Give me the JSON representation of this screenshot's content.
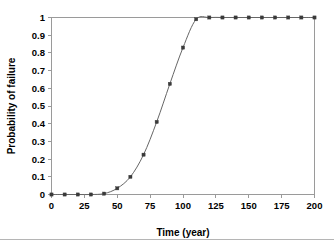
{
  "chart_data": {
    "type": "line",
    "title": "",
    "xlabel": "Time (year)",
    "ylabel": "Probability of failure",
    "xlim": [
      0,
      200
    ],
    "ylim": [
      0,
      1
    ],
    "grid": false,
    "legend": "none",
    "marker": "square",
    "line_color": "#666666",
    "marker_color": "#3a3a3a",
    "xticks": [
      0,
      25,
      50,
      75,
      100,
      125,
      150,
      175,
      200
    ],
    "xtick_labels": [
      "0",
      "25",
      "50",
      "75",
      "100",
      "125",
      "150",
      "175",
      "200"
    ],
    "yticks": [
      0,
      0.1,
      0.2,
      0.3,
      0.4,
      0.5,
      0.6,
      0.7,
      0.8,
      0.9,
      1
    ],
    "ytick_labels": [
      "0",
      "0.1",
      "0.2",
      "0.3",
      "0.4",
      "0.5",
      "0.6",
      "0.7",
      "0.8",
      "0.9",
      "1"
    ],
    "x": [
      0,
      10,
      20,
      30,
      40,
      50,
      60,
      70,
      80,
      90,
      100,
      110,
      120,
      130,
      140,
      150,
      160,
      170,
      180,
      190,
      200
    ],
    "values": [
      0,
      0,
      0,
      0,
      0.005,
      0.035,
      0.1,
      0.225,
      0.41,
      0.625,
      0.83,
      0.99,
      1,
      1,
      1,
      1,
      1,
      1,
      1,
      1,
      1
    ],
    "series": [
      {
        "name": "Probability of failure",
        "values": [
          0,
          0,
          0,
          0,
          0.005,
          0.035,
          0.1,
          0.225,
          0.41,
          0.625,
          0.83,
          0.99,
          1,
          1,
          1,
          1,
          1,
          1,
          1,
          1,
          1
        ]
      }
    ]
  },
  "axes": {
    "x_title": "Time (year)",
    "y_title": "Probability of failure"
  },
  "colors": {
    "frame": "#9a9a9a",
    "line": "#666666",
    "marker": "#3a3a3a",
    "background": "#ffffff",
    "footer_rule": "#b5b5b5"
  }
}
